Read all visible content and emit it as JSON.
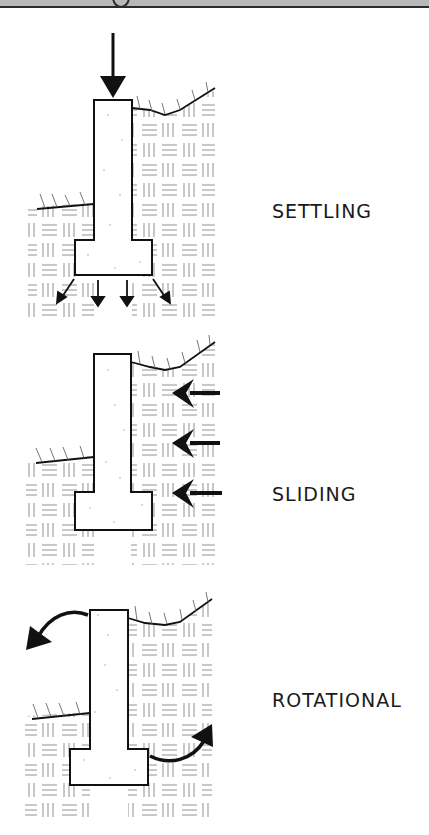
{
  "header": {
    "title_fragment": "g"
  },
  "diagrams": [
    {
      "id": "settling",
      "label": "SETTLING",
      "wall": {
        "stem": [
          94,
          100,
          132,
          240
        ],
        "footing": [
          75,
          240,
          152,
          275
        ]
      },
      "arrows": [
        "down-load-on-top",
        "4 downward-spread arrows under footing"
      ]
    },
    {
      "id": "sliding",
      "label": "SLIDING",
      "wall": {
        "stem": [
          94,
          354,
          131,
          492
        ],
        "footing": [
          75,
          492,
          152,
          530
        ]
      },
      "arrows": [
        "3 horizontal arrows pointing left against wall"
      ]
    },
    {
      "id": "rotational",
      "label": "ROTATIONAL",
      "wall": {
        "stem": [
          90,
          610,
          128,
          749
        ],
        "footing": [
          70,
          749,
          148,
          785
        ]
      },
      "arrows": [
        "curved arrow top-left away from wall",
        "curved arrow lower-right up from toe"
      ]
    }
  ],
  "colors": {
    "ink": "#111111",
    "soil_hatch": "#9a9a9a",
    "concrete_fill": "#ffffff",
    "header_band": "#b8b8b8"
  }
}
